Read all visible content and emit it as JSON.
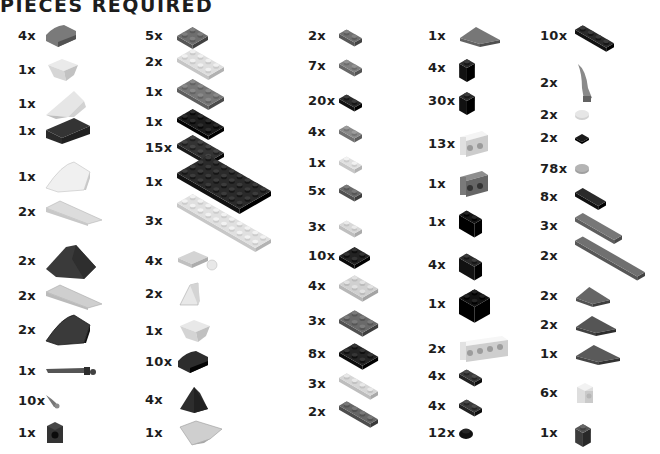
{
  "title": "PIECES REQUIRED",
  "columns": [
    {
      "items": [
        {
          "qty": "4x",
          "piece": "curved-slope-2x2",
          "color": "#7a7a7a"
        },
        {
          "qty": "1x",
          "piece": "inverted-slope-2x2",
          "color": "#d6d6d6"
        },
        {
          "qty": "1x",
          "piece": "wedge-slope",
          "color": "#e6e6e6"
        },
        {
          "qty": "1x",
          "piece": "slope-2x4",
          "color": "#2a2a2a"
        },
        {
          "qty": "1x",
          "piece": "curved-wedge",
          "color": "#f0f0f0"
        },
        {
          "qty": "2x",
          "piece": "wedge-plate-long",
          "color": "#dcdcdc"
        },
        {
          "qty": "2x",
          "piece": "wedge-slope-dark",
          "color": "#3a3a3a"
        },
        {
          "qty": "2x",
          "piece": "inverted-wedge-long",
          "color": "#cfcfcf"
        },
        {
          "qty": "2x",
          "piece": "curved-wedge-large",
          "color": "#3a3a3a"
        },
        {
          "qty": "1x",
          "piece": "bar-with-stud",
          "color": "#555555"
        },
        {
          "qty": "10x",
          "piece": "claw-small",
          "color": "#777777"
        },
        {
          "qty": "1x",
          "piece": "brick-1x1-round-hole",
          "color": "#333333"
        }
      ]
    },
    {
      "items": [
        {
          "qty": "5x",
          "piece": "plate-2x2",
          "color": "#6e6e6e"
        },
        {
          "qty": "2x",
          "piece": "plate-2x4",
          "color": "#dedede"
        },
        {
          "qty": "1x",
          "piece": "plate-2x4",
          "color": "#777777"
        },
        {
          "qty": "1x",
          "piece": "plate-2x4",
          "color": "#1c1c1c"
        },
        {
          "qty": "15x",
          "piece": "plate-2x4",
          "color": "#333333"
        },
        {
          "qty": "1x",
          "piece": "plate-4x8",
          "color": "#2a2a2a"
        },
        {
          "qty": "3x",
          "piece": "plate-2x10",
          "color": "#e0e0e0"
        },
        {
          "qty": "4x",
          "piece": "plate-2x2-ball",
          "color": "#d4d4d4"
        },
        {
          "qty": "2x",
          "piece": "slope-1x2",
          "color": "#e8e8e8"
        },
        {
          "qty": "1x",
          "piece": "inverted-slope-1x2",
          "color": "#d4d4d4"
        },
        {
          "qty": "10x",
          "piece": "curved-slope-2x2",
          "color": "#2d2d2d"
        },
        {
          "qty": "4x",
          "piece": "slope-corner-2x2",
          "color": "#2d2d2d"
        },
        {
          "qty": "1x",
          "piece": "wedge-inverted",
          "color": "#cfcfcf"
        }
      ]
    },
    {
      "items": [
        {
          "qty": "2x",
          "piece": "plate-1x2",
          "color": "#707070"
        },
        {
          "qty": "7x",
          "piece": "plate-1x2",
          "color": "#808080"
        },
        {
          "qty": "20x",
          "piece": "plate-1x2",
          "color": "#2a2a2a"
        },
        {
          "qty": "4x",
          "piece": "plate-1x2-clip",
          "color": "#8a8a8a"
        },
        {
          "qty": "1x",
          "piece": "plate-teeth",
          "color": "#e0e0e0"
        },
        {
          "qty": "5x",
          "piece": "plate-1x2-clip-top",
          "color": "#6a6a6a"
        },
        {
          "qty": "3x",
          "piece": "plate-1x2-handle",
          "color": "#d8d8d8"
        },
        {
          "qty": "10x",
          "piece": "plate-2x2",
          "color": "#222222"
        },
        {
          "qty": "4x",
          "piece": "plate-2x3",
          "color": "#d0d0d0"
        },
        {
          "qty": "3x",
          "piece": "plate-2x3",
          "color": "#6a6a6a"
        },
        {
          "qty": "8x",
          "piece": "plate-2x3",
          "color": "#242424"
        },
        {
          "qty": "3x",
          "piece": "plate-1x4",
          "color": "#d6d6d6"
        },
        {
          "qty": "2x",
          "piece": "plate-1x4",
          "color": "#666666"
        }
      ]
    },
    {
      "items": [
        {
          "qty": "1x",
          "piece": "wedge-plate-2x4",
          "color": "#777777"
        },
        {
          "qty": "4x",
          "piece": "brick-1x1",
          "color": "#2a2a2a"
        },
        {
          "qty": "30x",
          "piece": "brick-1x1-clip",
          "color": "#2a2a2a"
        },
        {
          "qty": "13x",
          "piece": "brick-1x2-studs-side",
          "color": "#e0e0e0"
        },
        {
          "qty": "1x",
          "piece": "brick-1x2-studs-side",
          "color": "#7a7a7a"
        },
        {
          "qty": "1x",
          "piece": "brick-1x2",
          "color": "#141414"
        },
        {
          "qty": "4x",
          "piece": "brick-1x2",
          "color": "#2a2a2a"
        },
        {
          "qty": "1x",
          "piece": "brick-2x2",
          "color": "#111111"
        },
        {
          "qty": "2x",
          "piece": "brick-1x4-studs-side",
          "color": "#e2e2e2"
        },
        {
          "qty": "4x",
          "piece": "plate-1x2-rail",
          "color": "#3a3a3a"
        },
        {
          "qty": "4x",
          "piece": "plate-1x2-clip-h",
          "color": "#3a3a3a"
        },
        {
          "qty": "12x",
          "piece": "round-plate-1x1",
          "color": "#111111"
        }
      ]
    },
    {
      "items": [
        {
          "qty": "10x",
          "piece": "plate-1x4",
          "color": "#2a2a2a"
        },
        {
          "qty": "2x",
          "piece": "horn",
          "color": "#8a8a8a"
        },
        {
          "qty": "2x",
          "piece": "round-tile-1x1",
          "color": "#e6e6e6"
        },
        {
          "qty": "2x",
          "piece": "tile-1x1",
          "color": "#1a1a1a"
        },
        {
          "qty": "78x",
          "piece": "round-tile-1x1",
          "color": "#b4b4b4"
        },
        {
          "qty": "8x",
          "piece": "tile-1x2",
          "color": "#2a2a2a"
        },
        {
          "qty": "3x",
          "piece": "tile-1x4",
          "color": "#777777"
        },
        {
          "qty": "2x",
          "piece": "tile-1x8",
          "color": "#707070"
        },
        {
          "qty": "2x",
          "piece": "wedge-plate-2x3",
          "color": "#666666"
        },
        {
          "qty": "2x",
          "piece": "wedge-plate-2x4",
          "color": "#555555"
        },
        {
          "qty": "1x",
          "piece": "wedge-plate-3x6",
          "color": "#5a5a5a"
        },
        {
          "qty": "6x",
          "piece": "brick-1x1-stud-side",
          "color": "#dedede"
        },
        {
          "qty": "1x",
          "piece": "brick-1x1",
          "color": "#555555"
        }
      ]
    }
  ]
}
